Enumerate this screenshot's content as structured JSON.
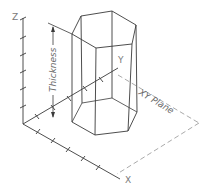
{
  "diagram": {
    "colors": {
      "line": "#3a3a3a",
      "dashed": "#9a9a9a",
      "text": "#6a6a6a",
      "background": "#ffffff"
    },
    "axes": {
      "z_label": "Z",
      "y_label": "Y",
      "x_label": "X"
    },
    "labels": {
      "thickness": "Thickness",
      "xy_plane": "XY Plane"
    }
  }
}
